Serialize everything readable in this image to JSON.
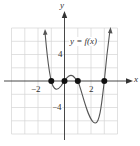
{
  "graph": {
    "function_label": "y = f(x)",
    "x_axis_label": "x",
    "y_axis_label": "y",
    "tick_labels": {
      "x_neg": "−2",
      "x_pos": "2",
      "y_pos": "4",
      "y_neg": "−4"
    },
    "x_intercepts": [
      -1,
      0,
      1,
      3
    ],
    "grid": {
      "x_range": [
        -4,
        4
      ],
      "y_range": [
        -8,
        8
      ],
      "x_step": 1,
      "y_step": 2
    },
    "colors": {
      "curve": "#555555",
      "grid": "#d0d0d0",
      "axis": "#333333",
      "point": "#111111"
    }
  }
}
